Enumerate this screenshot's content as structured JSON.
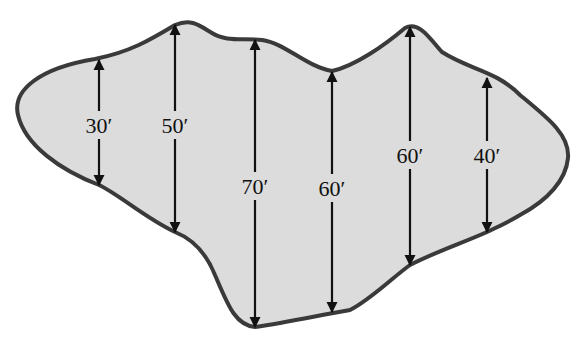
{
  "figure": {
    "fill_color": "#dcdcdc",
    "outline_color": "#3a3a3a",
    "measurements": [
      {
        "label": "30′",
        "value_ft": 30,
        "x": 99,
        "top": 60,
        "bottom": 185,
        "label_y": 125
      },
      {
        "label": "50′",
        "value_ft": 50,
        "x": 175,
        "top": 25,
        "bottom": 232,
        "label_y": 125
      },
      {
        "label": "70′",
        "value_ft": 70,
        "x": 255,
        "top": 40,
        "bottom": 327,
        "label_y": 186
      },
      {
        "label": "60′",
        "value_ft": 60,
        "x": 332,
        "top": 72,
        "bottom": 312,
        "label_y": 188
      },
      {
        "label": "60′",
        "value_ft": 60,
        "x": 410,
        "top": 27,
        "bottom": 265,
        "label_y": 155
      },
      {
        "label": "40′",
        "value_ft": 40,
        "x": 487,
        "top": 78,
        "bottom": 232,
        "label_y": 155
      }
    ]
  }
}
